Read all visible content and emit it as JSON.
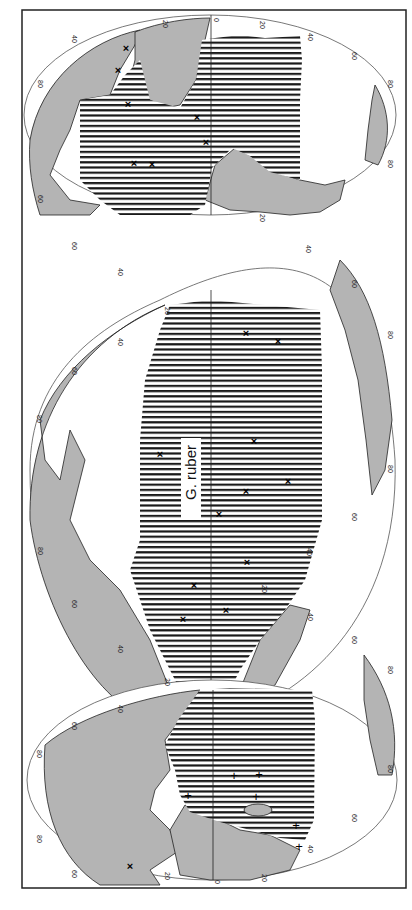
{
  "figure": {
    "species_label": "G. ruber",
    "orientation": "rotated 90° clockwise (north to the left, equator vertical)",
    "legend_symbols": {
      "hatched_area": "distribution range",
      "x_marker": "occurrence record",
      "plus_marker": "occurrence record (Indian Ocean)"
    },
    "colors": {
      "land": "#b4b4b4",
      "ocean": "#ffffff",
      "hatch": "#1a1a1a",
      "outline": "#222222"
    }
  },
  "latitude_ticks": [
    "80",
    "60",
    "40",
    "20",
    "0",
    "20",
    "40",
    "60",
    "80"
  ],
  "longitude_ticks": [
    "20",
    "40",
    "60",
    "80"
  ],
  "lobes": [
    {
      "name": "Atlantic Ocean",
      "markers": {
        "x": 8,
        "plus": 0
      }
    },
    {
      "name": "Pacific Ocean",
      "markers": {
        "x": 14,
        "plus": 0
      }
    },
    {
      "name": "Indian Ocean",
      "markers": {
        "x": 1,
        "plus": 7
      }
    }
  ]
}
